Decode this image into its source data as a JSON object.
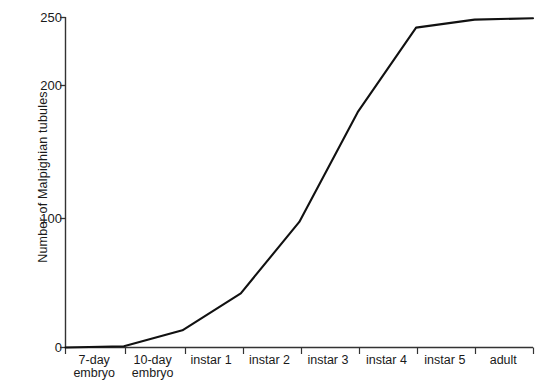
{
  "chart_data": {
    "type": "line",
    "title": "",
    "xlabel": "",
    "ylabel": "Number of Malpighian tubules",
    "categories": [
      "7-day embryo",
      "10-day embryo",
      "instar 1",
      "instar 2",
      "instar 3",
      "instar 4",
      "instar 5",
      "adult"
    ],
    "category_lines": [
      [
        "7-day",
        "embryo"
      ],
      [
        "10-day",
        "embryo"
      ],
      [
        "instar 1",
        ""
      ],
      [
        "instar 2",
        ""
      ],
      [
        "instar 3",
        ""
      ],
      [
        "instar 4",
        ""
      ],
      [
        "instar 5",
        ""
      ],
      [
        "adult",
        ""
      ]
    ],
    "values": [
      1,
      13,
      41,
      95,
      178,
      242,
      248,
      249
    ],
    "origin_value": 0,
    "ylim": [
      0,
      250
    ],
    "yticks": [
      0,
      100,
      200,
      250
    ],
    "ytick_labels": [
      "0",
      "100",
      "200",
      "250"
    ],
    "grid": false,
    "legend": "none",
    "line_color": "#111111",
    "axis_color": "#333333"
  }
}
